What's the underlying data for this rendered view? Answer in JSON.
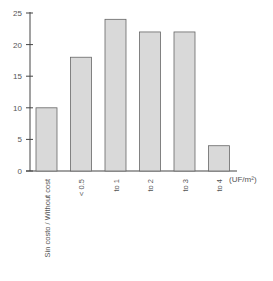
{
  "chart_data": {
    "type": "bar",
    "title": "",
    "xlabel": "(UF/m²)",
    "ylabel": "",
    "categories": [
      "Sin costo / Without cost",
      "< 0.5",
      "to 1",
      "to 2",
      "to 3",
      "to 4"
    ],
    "values": [
      10,
      18,
      24,
      22,
      22,
      4
    ],
    "ylim": [
      0,
      25
    ],
    "yticks": [
      0,
      5,
      10,
      15,
      20,
      25
    ],
    "grid": false,
    "legend": null,
    "bar_color": "#d9d9d9",
    "bar_edge_color": "#666666"
  },
  "labels": {
    "unit": "(UF/m²)",
    "yticks": [
      "0",
      "5",
      "10",
      "15",
      "20",
      "25"
    ],
    "categories": [
      "Sin costo / Without cost",
      "< 0.5",
      "to 1",
      "to 2",
      "to 3",
      "to 4"
    ]
  }
}
